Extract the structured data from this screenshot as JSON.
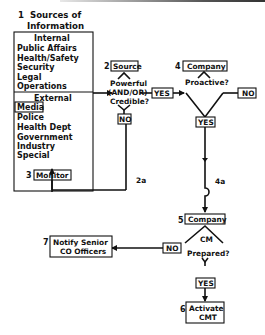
{
  "diagram": {
    "title": {
      "number": "1",
      "line1": "Sources of",
      "line2": "Information"
    },
    "sources_box": {
      "internal_header": "Internal",
      "internal": [
        "Public Affairs",
        "Health/Safety",
        "Security",
        "Legal",
        "Operations"
      ],
      "external_header": "External",
      "external": [
        "Media",
        "Police",
        "Health Dept",
        "Government",
        "Industry",
        "Special"
      ],
      "highlighted": "Media"
    },
    "nodes": {
      "source": {
        "number": "2",
        "label": "Source"
      },
      "source_question": {
        "line1": "Powerful",
        "line2": "(AND/OR)",
        "line3": "Credible?"
      },
      "source_yes": "YES",
      "source_no": "NO",
      "company4": {
        "number": "4",
        "label": "Company"
      },
      "proactive_question": "Proactive?",
      "proactive_no": "NO",
      "proactive_yes": "YES",
      "monitor": {
        "number": "3",
        "label": "Monitor"
      },
      "connector_2a": "2a",
      "connector_4a": "4a",
      "company5": {
        "number": "5",
        "label": "Company"
      },
      "cm_question": {
        "line1": "CM",
        "line2": "Prepared?"
      },
      "cm_no": "NO",
      "cm_yes": "YES",
      "notify": {
        "number": "7",
        "line1": "Notify  Senior",
        "line2": "CO  Officers"
      },
      "activate": {
        "number": "6",
        "line1": "Activate",
        "line2": "CMT"
      }
    }
  }
}
